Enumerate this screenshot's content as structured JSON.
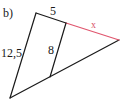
{
  "diagram": {
    "part_label": "b)",
    "type": "triangle-with-parallel-segment",
    "labels": {
      "top_segment": "5",
      "unknown_segment": "x",
      "left_side": "12,5",
      "parallel_segment": "8"
    },
    "colors": {
      "lines": "#1a1a1a",
      "highlight": "#e0566e"
    }
  }
}
